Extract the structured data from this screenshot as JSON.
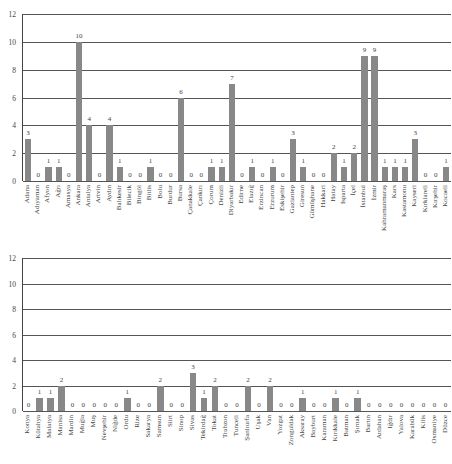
{
  "chart_data": [
    {
      "type": "bar",
      "title": "",
      "xlabel": "",
      "ylabel": "",
      "ylim": [
        0,
        12
      ],
      "yticks": [
        0,
        2,
        4,
        6,
        8,
        10,
        12
      ],
      "grid": true,
      "categories": [
        "Adana",
        "Adıyaman",
        "Afyon",
        "Ağrı",
        "Amasya",
        "Ankara",
        "Antalya",
        "Artvin",
        "Aydın",
        "Balıkesir",
        "Bilecik",
        "Bingöl",
        "Bitlis",
        "Bolu",
        "Burdur",
        "Bursa",
        "Çanakkale",
        "Çankırı",
        "Çorum",
        "Denizli",
        "Diyarbakır",
        "Edirne",
        "Elazığ",
        "Erzincan",
        "Erzurum",
        "Eskişehir",
        "Gaziantep",
        "Giresun",
        "Gümüşhane",
        "Hakkari",
        "Hatay",
        "Isparta",
        "İçel",
        "İstanbul",
        "İzmir",
        "Kahramanmaraş",
        "Kars",
        "Kastamonu",
        "Kayseri",
        "Kırklareli",
        "Kırşehir",
        "Kocaeli"
      ],
      "values": [
        3,
        0,
        1,
        1,
        0,
        10,
        4,
        0,
        4,
        1,
        0,
        0,
        1,
        0,
        0,
        6,
        0,
        0,
        1,
        1,
        7,
        0,
        1,
        0,
        1,
        0,
        3,
        1,
        0,
        0,
        2,
        1,
        2,
        9,
        9,
        1,
        1,
        1,
        3,
        0,
        0,
        1
      ]
    },
    {
      "type": "bar",
      "title": "",
      "xlabel": "",
      "ylabel": "",
      "ylim": [
        0,
        12
      ],
      "yticks": [
        0,
        2,
        4,
        6,
        8,
        10,
        12
      ],
      "grid": true,
      "categories": [
        "Konya",
        "Kütahya",
        "Malatya",
        "Manisa",
        "Mardin",
        "Muğla",
        "Muş",
        "Nevşehir",
        "Niğde",
        "Ordu",
        "Rize",
        "Sakarya",
        "Samsun",
        "Siirt",
        "Sinop",
        "Sivas",
        "Tekirdağ",
        "Tokat",
        "Trabzon",
        "Tunceli",
        "Şanlıurfa",
        "Uşak",
        "Van",
        "Yozgat",
        "Zonguldak",
        "Aksaray",
        "Bayburt",
        "Karaman",
        "Kırıkkale",
        "Batman",
        "Şırnak",
        "Bartın",
        "Ardahan",
        "Iğdır",
        "Yalova",
        "Karabük",
        "Kilis",
        "Osmaniye",
        "Düzce"
      ],
      "values": [
        0,
        1,
        1,
        2,
        0,
        0,
        0,
        0,
        0,
        1,
        0,
        0,
        2,
        0,
        0,
        3,
        1,
        2,
        0,
        0,
        2,
        0,
        2,
        0,
        0,
        1,
        0,
        0,
        1,
        0,
        1,
        0,
        0,
        0,
        0,
        0,
        0,
        0,
        0
      ]
    }
  ],
  "colors": {
    "bar": "#888888",
    "grid": "#555555"
  }
}
